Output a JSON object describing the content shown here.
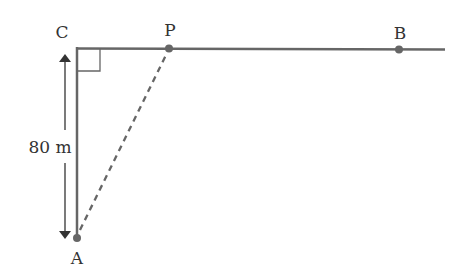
{
  "diagram": {
    "points": {
      "C": {
        "label": "C",
        "x": 77,
        "y": 48
      },
      "P": {
        "label": "P",
        "x": 169,
        "y": 48
      },
      "B": {
        "label": "B",
        "x": 399,
        "y": 49
      },
      "A": {
        "label": "A",
        "x": 77,
        "y": 238
      }
    },
    "dimension": {
      "label": "80 m",
      "between": [
        "C",
        "A"
      ]
    },
    "segments": [
      {
        "from": "C",
        "to": "B",
        "style": "solid",
        "extends_past": "B"
      },
      {
        "from": "C",
        "to": "A",
        "style": "solid"
      },
      {
        "from": "A",
        "to": "P",
        "style": "dashed"
      }
    ],
    "right_angle_at": "C",
    "colors": {
      "line": "#666666",
      "point": "#666666",
      "text": "#333333"
    }
  }
}
